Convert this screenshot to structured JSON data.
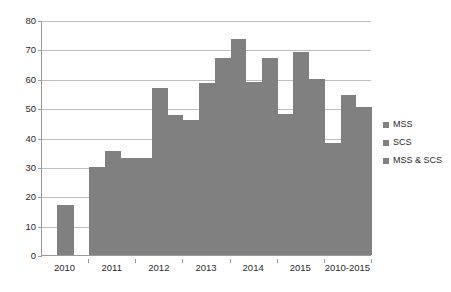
{
  "chart_data": {
    "type": "bar",
    "title": "",
    "subtitle": "",
    "xlabel": "",
    "ylabel": "",
    "ylim": [
      0,
      80
    ],
    "ytick_step": 10,
    "yticks": [
      "0",
      "10",
      "20",
      "30",
      "40",
      "50",
      "60",
      "70",
      "80"
    ],
    "grid": true,
    "legend_position": "right",
    "categories": [
      "2010",
      "2011",
      "2012",
      "2013",
      "2014",
      "2015",
      "2010-2015"
    ],
    "series": [
      {
        "name": "MSS",
        "color": "#808080",
        "values": [
          17,
          30,
          33,
          46,
          73.5,
          48,
          38
        ]
      },
      {
        "name": "SCS",
        "color": "#808080",
        "values": [
          null,
          35.5,
          57,
          58.5,
          59,
          69,
          54.5
        ]
      },
      {
        "name": "MSS & SCS",
        "color": "#808080",
        "values": [
          null,
          33,
          47.5,
          67,
          67,
          60,
          50.5
        ]
      }
    ]
  },
  "legend": {
    "items": [
      {
        "label": "MSS"
      },
      {
        "label": "SCS"
      },
      {
        "label": "MSS & SCS"
      }
    ]
  },
  "axis": {
    "y_labels": [
      "80",
      "70",
      "60",
      "50",
      "40",
      "30",
      "20",
      "10",
      "0"
    ],
    "x_labels": [
      "2010",
      "2011",
      "2012",
      "2013",
      "2014",
      "2015",
      "2010-2015"
    ]
  },
  "colors": {
    "bar": "#808080",
    "gridline": "#bfbfbf",
    "axis": "#9a9a9a",
    "text": "#2b2b2b",
    "background": "#ffffff"
  }
}
